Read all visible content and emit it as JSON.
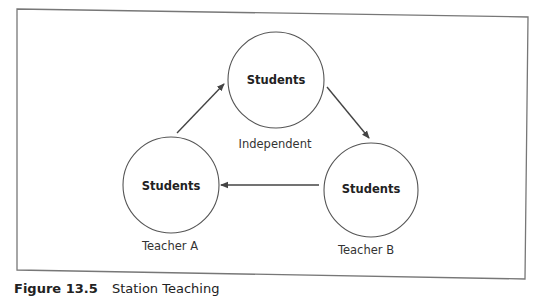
{
  "diagram": {
    "type": "cycle",
    "nodes": [
      {
        "id": "independent",
        "label": "Students",
        "caption": "Independent"
      },
      {
        "id": "teacher_b",
        "label": "Students",
        "caption": "Teacher B"
      },
      {
        "id": "teacher_a",
        "label": "Students",
        "caption": "Teacher A"
      }
    ],
    "edges": [
      {
        "from": "teacher_a",
        "to": "independent"
      },
      {
        "from": "independent",
        "to": "teacher_b"
      },
      {
        "from": "teacher_b",
        "to": "teacher_a"
      }
    ],
    "colors": {
      "stroke": "#555555",
      "arrow": "#444444",
      "frame": "#777777"
    }
  },
  "caption": {
    "figure_number": "Figure 13.5",
    "title": "Station Teaching"
  }
}
